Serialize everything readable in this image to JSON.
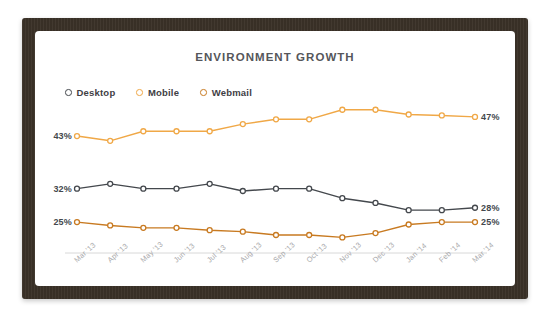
{
  "card": {
    "title": "ENVIRONMENT GROWTH"
  },
  "legend": {
    "position": "top-left",
    "items": [
      {
        "label": "Desktop",
        "color": "#44484d",
        "marker": "open-circle"
      },
      {
        "label": "Mobile",
        "color": "#f0a847",
        "marker": "open-circle"
      },
      {
        "label": "Webmail",
        "color": "#c87a21",
        "marker": "open-circle"
      }
    ]
  },
  "colors": {
    "frame": "#3b3228",
    "card_background": "#ffffff",
    "title_text": "#55565a",
    "axis": "#d8d8d8",
    "tick_label": "#a9a9ab",
    "desktop": "#44484d",
    "mobile": "#f0a847",
    "webmail": "#c87a21"
  },
  "chart_data": {
    "type": "line",
    "title": "ENVIRONMENT GROWTH",
    "xlabel": "",
    "ylabel": "",
    "ylim": [
      20,
      52
    ],
    "grid": false,
    "legend_position": "top-left",
    "x": [
      "Mar '13",
      "Apr '13",
      "May '13",
      "Jun '13",
      "Jul '13",
      "Aug '13",
      "Sep '13",
      "Oct '13",
      "Nov '13",
      "Dec '13",
      "Jan '14",
      "Feb '14",
      "Mar '14"
    ],
    "series": [
      {
        "name": "Desktop",
        "color": "#44484d",
        "values": [
          32,
          33,
          32,
          32,
          33,
          31.5,
          32,
          32,
          30,
          29,
          27.5,
          27.5,
          28
        ],
        "start_label": "32%",
        "end_label": "28%"
      },
      {
        "name": "Mobile",
        "color": "#f0a847",
        "values": [
          43,
          42,
          44,
          44,
          44,
          45.5,
          46.5,
          46.5,
          48.5,
          48.5,
          47.5,
          47.3,
          47
        ],
        "start_label": "43%",
        "end_label": "47%"
      },
      {
        "name": "Webmail",
        "color": "#c87a21",
        "values": [
          25,
          24.3,
          23.8,
          23.8,
          23.3,
          23,
          22.3,
          22.3,
          21.8,
          22.7,
          24.5,
          25,
          25
        ],
        "start_label": "25%",
        "end_label": "25%"
      }
    ],
    "value_labels": {
      "left": [
        {
          "text": "43%",
          "series": "Mobile",
          "color": "#44484d"
        },
        {
          "text": "32%",
          "series": "Desktop",
          "color": "#44484d"
        },
        {
          "text": "25%",
          "series": "Webmail",
          "color": "#44484d"
        }
      ],
      "right": [
        {
          "text": "47%",
          "series": "Mobile",
          "color": "#44484d"
        },
        {
          "text": "28%",
          "series": "Desktop",
          "color": "#44484d"
        },
        {
          "text": "25%",
          "series": "Webmail",
          "color": "#44484d"
        }
      ]
    }
  }
}
